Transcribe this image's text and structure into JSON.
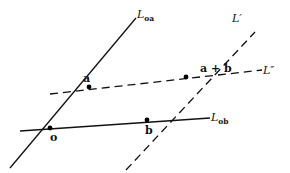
{
  "diagram": {
    "lines": [
      {
        "id": "L_oa",
        "label_main": "L",
        "label_sub": "oa",
        "style": "solid"
      },
      {
        "id": "L_ob",
        "label_main": "L",
        "label_sub": "ob",
        "style": "solid"
      },
      {
        "id": "L_prime",
        "label_main": "L′",
        "style": "dashed"
      },
      {
        "id": "L_double_prime",
        "label_main": "L″",
        "style": "dashed"
      }
    ],
    "points": [
      {
        "id": "o",
        "label": "o"
      },
      {
        "id": "a",
        "label": "a"
      },
      {
        "id": "b",
        "label": "b"
      },
      {
        "id": "a_plus_b",
        "label": "a + b"
      }
    ],
    "colors": {
      "ink": "#111111",
      "background": "#ffffff"
    }
  }
}
